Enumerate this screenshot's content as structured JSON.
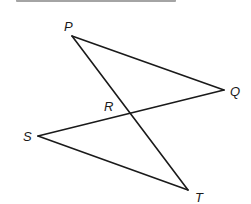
{
  "heading": {
    "text_visible": false,
    "note": "top line of text cropped off"
  },
  "figure": {
    "type": "geometry",
    "stroke_color": "#1a1a1a",
    "points": {
      "P": {
        "label": "P",
        "x": 72,
        "y": 36,
        "label_x": 64,
        "label_y": 31
      },
      "Q": {
        "label": "Q",
        "x": 224,
        "y": 90,
        "label_x": 230,
        "label_y": 96
      },
      "R": {
        "label": "R",
        "x": 130,
        "y": 114,
        "label_x": 104,
        "label_y": 111
      },
      "S": {
        "label": "S",
        "x": 38,
        "y": 136,
        "label_x": 23,
        "label_y": 141
      },
      "T": {
        "label": "T",
        "x": 188,
        "y": 190,
        "label_x": 195,
        "label_y": 202
      }
    },
    "segments": [
      {
        "name": "PQ",
        "from": "P",
        "to": "Q"
      },
      {
        "name": "PT",
        "from": "P",
        "to": "T"
      },
      {
        "name": "QS",
        "from": "Q",
        "to": "S"
      },
      {
        "name": "ST",
        "from": "S",
        "to": "T"
      }
    ]
  }
}
